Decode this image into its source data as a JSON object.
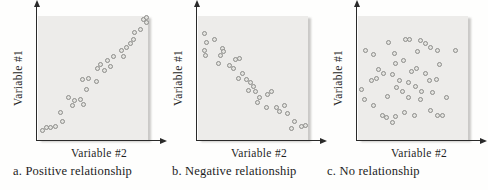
{
  "figure": {
    "panels": [
      {
        "caption": "a. Positive relationship",
        "x_label": "Variable #2",
        "y_label": "Variable #1"
      },
      {
        "caption": "b. Negative relationship",
        "x_label": "Variable #2",
        "y_label": "Variable #1"
      },
      {
        "caption": "c. No relationship",
        "x_label": "Variable #2",
        "y_label": "Variable #1"
      }
    ]
  },
  "colors": {
    "plot_background": "#edecea",
    "plot_shadow": "#8c8a84",
    "point_fill": "#e3e3df",
    "point_stroke": "#8d8d8b",
    "axis": "#2a2a2a",
    "text": "#1f1f1f"
  },
  "chart_data": [
    {
      "type": "scatter",
      "title": "a. Positive relationship",
      "xlabel": "Variable #2",
      "ylabel": "Variable #1",
      "xlim": [
        0,
        100
      ],
      "ylim": [
        0,
        100
      ],
      "ticks": "none",
      "legend": "none",
      "points": [
        [
          96,
          97
        ],
        [
          99,
          99
        ],
        [
          99,
          95
        ],
        [
          93,
          89
        ],
        [
          88,
          87
        ],
        [
          87,
          81
        ],
        [
          84,
          78
        ],
        [
          80,
          75
        ],
        [
          76,
          72
        ],
        [
          78,
          67
        ],
        [
          69,
          67
        ],
        [
          63,
          64
        ],
        [
          66,
          59
        ],
        [
          57,
          61
        ],
        [
          54,
          58
        ],
        [
          60,
          56
        ],
        [
          40,
          49
        ],
        [
          46,
          50
        ],
        [
          53,
          47
        ],
        [
          44,
          41
        ],
        [
          28,
          34
        ],
        [
          33,
          32
        ],
        [
          39,
          33
        ],
        [
          31,
          28
        ],
        [
          41,
          29
        ],
        [
          20,
          22
        ],
        [
          8,
          10
        ],
        [
          16,
          11
        ],
        [
          22,
          15
        ],
        [
          4,
          8
        ],
        [
          11,
          10
        ]
      ]
    },
    {
      "type": "scatter",
      "title": "b. Negative relationship",
      "xlabel": "Variable #2",
      "ylabel": "Variable #1",
      "xlim": [
        0,
        100
      ],
      "ylim": [
        0,
        100
      ],
      "ticks": "none",
      "legend": "none",
      "points": [
        [
          6,
          86
        ],
        [
          8,
          79
        ],
        [
          6,
          72
        ],
        [
          7,
          68
        ],
        [
          15,
          81
        ],
        [
          22,
          74
        ],
        [
          23,
          71
        ],
        [
          20,
          68
        ],
        [
          19,
          62
        ],
        [
          29,
          60
        ],
        [
          34,
          65
        ],
        [
          38,
          66
        ],
        [
          32,
          58
        ],
        [
          40,
          54
        ],
        [
          37,
          50
        ],
        [
          44,
          49
        ],
        [
          48,
          46
        ],
        [
          50,
          43
        ],
        [
          46,
          40
        ],
        [
          52,
          39
        ],
        [
          56,
          34
        ],
        [
          54,
          30
        ],
        [
          63,
          37
        ],
        [
          67,
          39
        ],
        [
          62,
          26
        ],
        [
          71,
          26
        ],
        [
          74,
          23
        ],
        [
          79,
          28
        ],
        [
          81,
          21
        ],
        [
          88,
          15
        ],
        [
          85,
          9
        ],
        [
          94,
          11
        ],
        [
          98,
          12
        ]
      ]
    },
    {
      "type": "scatter",
      "title": "c. No relationship",
      "xlabel": "Variable #2",
      "ylabel": "Variable #1",
      "xlim": [
        0,
        100
      ],
      "ylim": [
        0,
        100
      ],
      "ticks": "none",
      "legend": "none",
      "points": [
        [
          43,
          81
        ],
        [
          47,
          81
        ],
        [
          57,
          80
        ],
        [
          61,
          78
        ],
        [
          28,
          79
        ],
        [
          66,
          75
        ],
        [
          7,
          72
        ],
        [
          89,
          72
        ],
        [
          14,
          69
        ],
        [
          33,
          70
        ],
        [
          54,
          71
        ],
        [
          72,
          72
        ],
        [
          34,
          62
        ],
        [
          41,
          64
        ],
        [
          19,
          57
        ],
        [
          23,
          54
        ],
        [
          31,
          53
        ],
        [
          49,
          55
        ],
        [
          53,
          58
        ],
        [
          61,
          54
        ],
        [
          74,
          61
        ],
        [
          12,
          48
        ],
        [
          17,
          50
        ],
        [
          38,
          48
        ],
        [
          46,
          46
        ],
        [
          65,
          48
        ],
        [
          71,
          49
        ],
        [
          3,
          41
        ],
        [
          35,
          42
        ],
        [
          40,
          39
        ],
        [
          52,
          43
        ],
        [
          58,
          39
        ],
        [
          68,
          38
        ],
        [
          80,
          34
        ],
        [
          6,
          33
        ],
        [
          14,
          28
        ],
        [
          27,
          35
        ],
        [
          46,
          34
        ],
        [
          57,
          33
        ],
        [
          66,
          24
        ],
        [
          22,
          20
        ],
        [
          26,
          18
        ],
        [
          34,
          19
        ],
        [
          42,
          22
        ],
        [
          51,
          20
        ],
        [
          72,
          20
        ],
        [
          77,
          20
        ],
        [
          31,
          14
        ]
      ]
    }
  ]
}
